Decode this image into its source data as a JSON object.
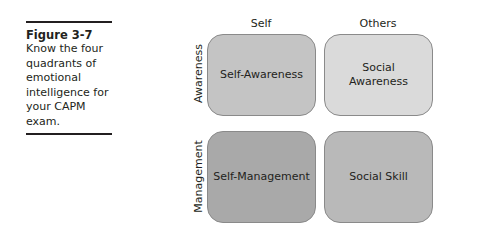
{
  "caption": {
    "figure_label": "Figure 3-7",
    "text": "Know the four quadrants of emotional intelligence for your CAPM exam."
  },
  "diagram": {
    "columns": [
      "Self",
      "Others"
    ],
    "rows": [
      "Awareness",
      "Management"
    ],
    "quadrants": [
      {
        "label": "Self-Awareness",
        "color": "#c4c4c4"
      },
      {
        "label": "Social Awareness",
        "color": "#dadada"
      },
      {
        "label": "Self-Management",
        "color": "#a9a9a9"
      },
      {
        "label": "Social Skill",
        "color": "#b9b9b9"
      }
    ]
  }
}
